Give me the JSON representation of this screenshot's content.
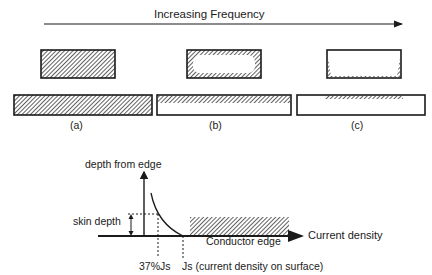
{
  "top": {
    "arrow_label": "Increasing Frequency"
  },
  "panels": [
    {
      "label": "(a)",
      "description": "uniform current distribution across cross-section"
    },
    {
      "label": "(b)",
      "description": "current concentrated near edges"
    },
    {
      "label": "(c)",
      "description": "current confined to thin surface layer"
    }
  ],
  "graph": {
    "y_axis_label": "depth from edge",
    "x_axis_label": "Current density",
    "skin_depth_label": "skin depth",
    "conductor_label": "Conductor edge",
    "tick_37_label": "37%Js",
    "tick_js_label": "Js (current density on surface)"
  },
  "colors": {
    "ink": "#1a1a1a",
    "hatch": "#444444",
    "background": "#ffffff"
  }
}
